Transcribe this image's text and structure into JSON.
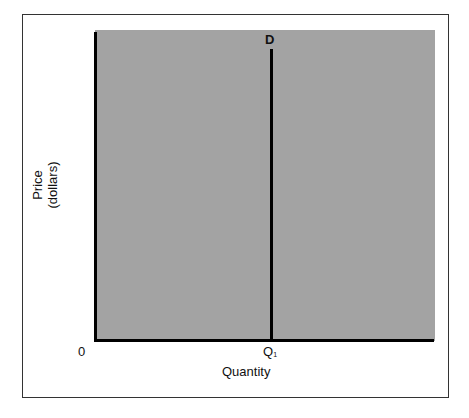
{
  "chart_data": {
    "type": "line",
    "title": "",
    "xlabel": "Quantity",
    "ylabel": "Price (dollars)",
    "ylabel_lines": [
      "Price",
      "(dollars)"
    ],
    "origin_label": "0",
    "x_ticks": [
      {
        "label": "Q1",
        "position": "Q1"
      }
    ],
    "series": [
      {
        "name": "D",
        "description": "Perfectly inelastic (vertical) demand curve at Q1",
        "points": [
          {
            "x": "Q1",
            "y": "min"
          },
          {
            "x": "Q1",
            "y": "max"
          }
        ]
      }
    ],
    "annotations": [
      {
        "text": "D",
        "at": "top of demand curve"
      }
    ],
    "grid": false,
    "legend": "none",
    "background_color": "#a3a3a3"
  },
  "labels": {
    "d": "D",
    "zero": "0",
    "q": "Q",
    "q_sub": "1",
    "xlabel": "Quantity",
    "ylabel_1": "Price",
    "ylabel_2": "(dollars)"
  }
}
